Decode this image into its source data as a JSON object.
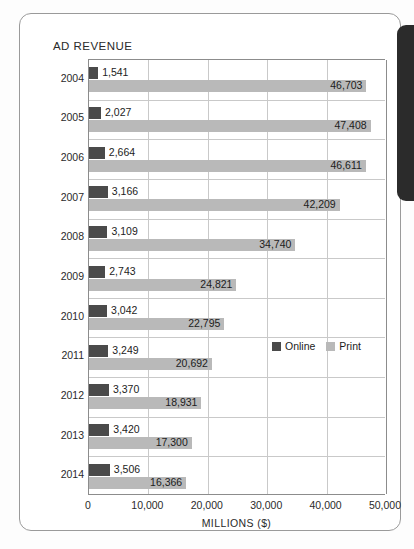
{
  "card": {
    "title": "AD REVENUE",
    "edge_tab_name": "page-edge-tab"
  },
  "legend": {
    "items": [
      {
        "label": "Online",
        "color": "#4a4a4a"
      },
      {
        "label": "Print",
        "color": "#b9b9b9"
      }
    ]
  },
  "axis": {
    "xlabel": "MILLIONS ($)",
    "ticks": [
      "0",
      "10,000",
      "20,000",
      "30,000",
      "40,000",
      "50,000"
    ]
  },
  "chart_data": {
    "type": "bar",
    "title": "AD REVENUE",
    "subtitle": "",
    "orientation": "horizontal",
    "grouping": "grouped",
    "xlabel": "MILLIONS ($)",
    "ylabel": "",
    "xlim": [
      0,
      50000
    ],
    "xticks": [
      0,
      10000,
      20000,
      30000,
      40000,
      50000
    ],
    "xtick_labels": [
      "0",
      "10,000",
      "20,000",
      "30,000",
      "40,000",
      "50,000"
    ],
    "grid": "vertical",
    "legend_position": "inside-right-middle",
    "categories": [
      "2004",
      "2005",
      "2006",
      "2007",
      "2008",
      "2009",
      "2010",
      "2011",
      "2012",
      "2013",
      "2014"
    ],
    "series": [
      {
        "name": "Online",
        "color": "#4a4a4a",
        "values": [
          1541,
          2027,
          2664,
          3166,
          3109,
          2743,
          3042,
          3249,
          3370,
          3420,
          3506
        ],
        "labels": [
          "1,541",
          "2,027",
          "2,664",
          "3,166",
          "3,109",
          "2,743",
          "3,042",
          "3,249",
          "3,370",
          "3,420",
          "3,506"
        ]
      },
      {
        "name": "Print",
        "color": "#b9b9b9",
        "values": [
          46703,
          47408,
          46611,
          42209,
          34740,
          24821,
          22795,
          20692,
          18931,
          17300,
          16366
        ],
        "labels": [
          "46,703",
          "47,408",
          "46,611",
          "42,209",
          "34,740",
          "24,821",
          "22,795",
          "20,692",
          "18,931",
          "17,300",
          "16,366"
        ]
      }
    ]
  }
}
